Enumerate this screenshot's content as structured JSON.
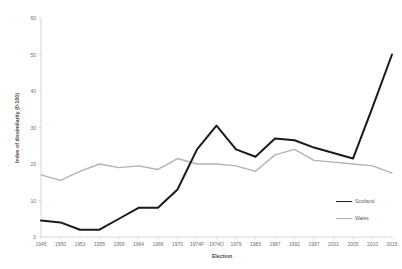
{
  "chart_data": {
    "type": "line",
    "title": "",
    "xlabel": "Election",
    "ylabel": "Index of dissimilarity (0-100)",
    "ylim": [
      0,
      60
    ],
    "yticks": [
      0,
      10,
      20,
      30,
      40,
      50,
      60
    ],
    "grid": false,
    "legend_position": "right-inside",
    "categories": [
      "1945",
      "1950",
      "1951",
      "1955",
      "1959",
      "1964",
      "1966",
      "1970",
      "1974F",
      "1974O",
      "1979",
      "1983",
      "1987",
      "1992",
      "1997",
      "2001",
      "2005",
      "2010",
      "2015"
    ],
    "series": [
      {
        "name": "Scotland",
        "color": "#1a1a1a",
        "values": [
          4.5,
          4.0,
          2.0,
          2.0,
          5.0,
          8.0,
          8.0,
          13.0,
          24.0,
          30.5,
          24.0,
          22.0,
          27.0,
          26.5,
          24.5,
          23.0,
          21.5,
          35.5,
          50.0
        ]
      },
      {
        "name": "Wales",
        "color": "#b3b3b3",
        "values": [
          17.0,
          15.5,
          18.0,
          20.0,
          19.0,
          19.5,
          18.5,
          21.5,
          20.0,
          20.0,
          19.5,
          18.0,
          22.5,
          24.0,
          21.0,
          20.5,
          20.0,
          19.5,
          17.5
        ]
      }
    ]
  },
  "legend": {
    "items": [
      {
        "label": "Scotland"
      },
      {
        "label": "Wales"
      }
    ]
  },
  "colors": {
    "scotland": "#1a1a1a",
    "wales": "#b3b3b3",
    "axis": "#d4d4d4",
    "tick_text": "#6f6f6f",
    "background": "#ffffff"
  }
}
